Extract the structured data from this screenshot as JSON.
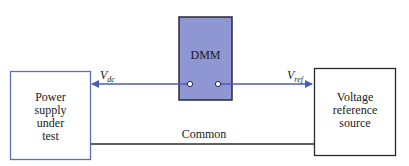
{
  "diagram": {
    "dmm": {
      "label": "DMM",
      "fill": "#8e97d2",
      "stroke": "#2a2a3a"
    },
    "power_supply": {
      "lines": [
        "Power",
        "supply",
        "under",
        "test"
      ],
      "stroke": "#5b6fc4"
    },
    "reference": {
      "lines": [
        "Voltage",
        "reference",
        "source"
      ],
      "stroke": "#2a2a2a"
    },
    "vdc": {
      "main": "V",
      "sub": "dc"
    },
    "vref": {
      "main": "V",
      "sub": "ref"
    },
    "common": {
      "label": "Common"
    },
    "colors": {
      "signal_line": "#4b5cb8",
      "common_line": "#2a2a2a"
    }
  }
}
